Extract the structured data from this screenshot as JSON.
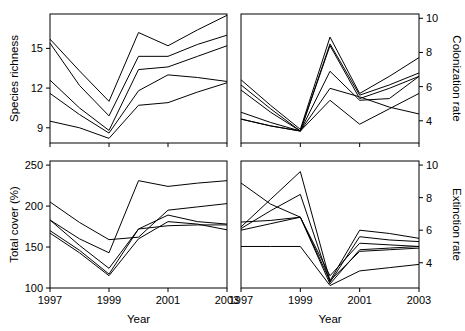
{
  "figure": {
    "title": "",
    "xlabel": "Year",
    "panels": [
      "species-richness",
      "colonization-rate",
      "total-cover",
      "extinction-rate"
    ]
  },
  "chart_data": [
    {
      "id": "species-richness",
      "position": "top-left",
      "type": "line",
      "title": "",
      "xlabel": "Year",
      "ylabel": "Species richness",
      "yaxis_side": "left",
      "x": [
        1997,
        1998,
        1999,
        2000,
        2001,
        2002,
        2003
      ],
      "xticks": [
        1997,
        1999,
        2001,
        2003
      ],
      "xticklabels": [
        "1997",
        "1999",
        "2001",
        "2003"
      ],
      "xlim": [
        1997,
        2003
      ],
      "yticks": [
        9,
        12,
        15
      ],
      "yticklabels": [
        "9",
        "12",
        "15"
      ],
      "ylim": [
        7.85,
        17.6
      ],
      "grid": false,
      "legend": "none",
      "series": [
        {
          "name": "site-1",
          "values": [
            15.7,
            13.3,
            11.0,
            16.2,
            15.2,
            16.4,
            17.5
          ]
        },
        {
          "name": "site-2",
          "values": [
            15.4,
            12.2,
            9.9,
            14.4,
            14.4,
            15.3,
            16.0
          ]
        },
        {
          "name": "site-3",
          "values": [
            12.6,
            10.5,
            8.8,
            13.4,
            13.6,
            14.4,
            15.2
          ]
        },
        {
          "name": "site-4",
          "values": [
            11.6,
            10.0,
            8.6,
            11.8,
            13.0,
            12.8,
            12.5
          ]
        },
        {
          "name": "site-5",
          "values": [
            9.5,
            9.0,
            8.2,
            10.7,
            10.9,
            11.7,
            12.4
          ]
        }
      ]
    },
    {
      "id": "colonization-rate",
      "position": "top-right",
      "type": "line",
      "title": "",
      "xlabel": "Year",
      "ylabel": "Colonization rate",
      "yaxis_side": "right",
      "x": [
        1997,
        1998,
        1999,
        2000,
        2001,
        2002,
        2003
      ],
      "xticks": [
        1997,
        1999,
        2001,
        2003
      ],
      "xticklabels": [
        "1997",
        "1999",
        "2001",
        "2003"
      ],
      "xlim": [
        1997,
        2003
      ],
      "yticks": [
        4,
        6,
        8,
        10
      ],
      "yticklabels": [
        "4",
        "6",
        "8",
        "10"
      ],
      "ylim": [
        2.7,
        10.25
      ],
      "grid": false,
      "legend": "none",
      "series": [
        {
          "name": "site-1",
          "values": [
            6.4,
            4.9,
            3.5,
            8.9,
            5.6,
            6.6,
            7.7
          ]
        },
        {
          "name": "site-2",
          "values": [
            6.1,
            4.7,
            3.4,
            8.5,
            5.5,
            6.1,
            6.8
          ]
        },
        {
          "name": "site-3",
          "values": [
            5.8,
            4.5,
            3.4,
            8.4,
            5.3,
            5.9,
            6.6
          ]
        },
        {
          "name": "site-4",
          "values": [
            4.5,
            3.9,
            3.4,
            6.9,
            5.2,
            5.3,
            6.6
          ]
        },
        {
          "name": "site-5",
          "values": [
            4.1,
            3.7,
            3.4,
            5.9,
            5.4,
            4.8,
            4.4
          ]
        },
        {
          "name": "site-6",
          "values": [
            4.1,
            3.7,
            3.4,
            5.2,
            3.8,
            4.7,
            5.6
          ]
        }
      ]
    },
    {
      "id": "total-cover",
      "position": "bottom-left",
      "type": "line",
      "title": "",
      "xlabel": "Year",
      "ylabel": "Total cover (%)",
      "yaxis_side": "left",
      "x": [
        1997,
        1998,
        1999,
        2000,
        2001,
        2002,
        2003
      ],
      "xticks": [
        1997,
        1999,
        2001,
        2003
      ],
      "xticklabels": [
        "1997",
        "1999",
        "2001",
        "2003"
      ],
      "xlim": [
        1997,
        2003
      ],
      "yticks": [
        100,
        150,
        200,
        250
      ],
      "yticklabels": [
        "100",
        "150",
        "200",
        "250"
      ],
      "ylim": [
        100,
        255
      ],
      "grid": false,
      "legend": "none",
      "series": [
        {
          "name": "site-1",
          "values": [
            183,
            160,
            143,
            231,
            224,
            228,
            231
          ]
        },
        {
          "name": "site-2",
          "values": [
            205,
            180,
            159,
            162,
            195,
            199,
            203
          ]
        },
        {
          "name": "site-3",
          "values": [
            183,
            152,
            124,
            172,
            189,
            181,
            178
          ]
        },
        {
          "name": "site-4",
          "values": [
            170,
            146,
            117,
            172,
            176,
            177,
            177
          ]
        },
        {
          "name": "site-5",
          "values": [
            167,
            143,
            115,
            160,
            181,
            178,
            171
          ]
        }
      ]
    },
    {
      "id": "extinction-rate",
      "position": "bottom-right",
      "type": "line",
      "title": "",
      "xlabel": "Year",
      "ylabel": "Extinction rate",
      "yaxis_side": "right",
      "x": [
        1997,
        1998,
        1999,
        2000,
        2001,
        2002,
        2003
      ],
      "xticks": [
        1997,
        1999,
        2001,
        2003
      ],
      "xticklabels": [
        "1997",
        "1999",
        "2001",
        "2003"
      ],
      "xlim": [
        1997,
        2003
      ],
      "yticks": [
        4,
        6,
        8,
        10
      ],
      "yticklabels": [
        "4",
        "6",
        "8",
        "10"
      ],
      "ylim": [
        2.45,
        10.25
      ],
      "grid": false,
      "legend": "none",
      "series": [
        {
          "name": "site-1",
          "values": [
            6.2,
            7.9,
            9.6,
            2.9,
            6.0,
            5.8,
            5.5
          ]
        },
        {
          "name": "site-2",
          "values": [
            6.1,
            7.2,
            8.2,
            2.8,
            5.6,
            5.4,
            5.3
          ]
        },
        {
          "name": "site-3",
          "values": [
            8.9,
            7.6,
            6.8,
            3.2,
            5.2,
            5.1,
            5.0
          ]
        },
        {
          "name": "site-4",
          "values": [
            6.5,
            6.6,
            6.8,
            2.7,
            4.8,
            4.9,
            5.0
          ]
        },
        {
          "name": "site-5",
          "values": [
            5.0,
            5.0,
            5.0,
            2.6,
            3.5,
            3.7,
            3.9
          ]
        },
        {
          "name": "site-6",
          "values": [
            6.0,
            6.4,
            6.8,
            2.9,
            4.7,
            4.8,
            4.9
          ]
        }
      ]
    }
  ]
}
